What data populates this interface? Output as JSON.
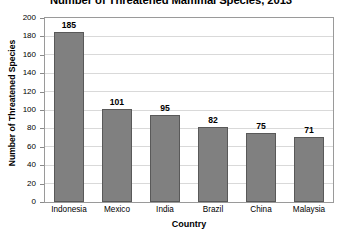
{
  "chart_data": {
    "type": "bar",
    "title": "Number of Threatened Mammal Species, 2013",
    "xlabel": "Country",
    "ylabel": "Number of Threatened Species",
    "categories": [
      "Indonesia",
      "Mexico",
      "India",
      "Brazil",
      "China",
      "Malaysia"
    ],
    "values": [
      185,
      101,
      95,
      82,
      75,
      71
    ],
    "value_labels": [
      "185",
      "101",
      "95",
      "82",
      "75",
      "71"
    ],
    "ylim": [
      0,
      200
    ],
    "ytick_step": 20,
    "yticks": [
      0,
      20,
      40,
      60,
      80,
      100,
      120,
      140,
      160,
      180,
      200
    ],
    "ytick_labels": [
      "0",
      "20",
      "40",
      "60",
      "80",
      "100",
      "120",
      "140",
      "160",
      "180",
      "200"
    ],
    "grid": true,
    "grid_axis": "y",
    "legend": false,
    "bar_color": "#808080",
    "bar_edge_color": "#595959",
    "grid_color": "#d9d9d9",
    "frame_color": "#9a9a9a",
    "background_color": "#ffffff"
  }
}
